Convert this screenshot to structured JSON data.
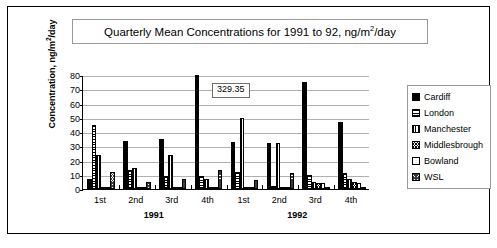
{
  "chart_data": {
    "type": "bar",
    "title": "Quarterly Mean Concentrations for 1991 to 92, ng/m2/day",
    "title_parts": {
      "before_sup": "Quarterly Mean Concentrations for 1991 to 92, ng/m",
      "sup": "2",
      "after_sup": "/day"
    },
    "xlabel": "",
    "ylabel": "Concentration, ng/m2/day",
    "ylabel_parts": {
      "before_sup": "Concentration, ng/m",
      "sup": "2",
      "after_sup": "/day"
    },
    "ylim": [
      0,
      80
    ],
    "yticks": [
      0,
      10,
      20,
      30,
      40,
      50,
      60,
      70,
      80
    ],
    "grid": true,
    "legend_position": "right",
    "categories": [
      "1st",
      "2nd",
      "3rd",
      "4th",
      "1st",
      "2nd",
      "3rd",
      "4th"
    ],
    "group_labels": [
      "1991",
      "1992"
    ],
    "series": [
      {
        "name": "Cardiff",
        "values": [
          7,
          34,
          35,
          329.35,
          33,
          32,
          75,
          47
        ]
      },
      {
        "name": "London",
        "values": [
          45,
          13,
          9,
          9,
          12,
          2,
          10,
          11
        ]
      },
      {
        "name": "Manchester",
        "values": [
          24,
          15,
          24,
          7,
          50,
          32,
          5,
          7
        ]
      },
      {
        "name": "Middlesbrough",
        "values": [
          0,
          0,
          0,
          0,
          0,
          0,
          4,
          5
        ]
      },
      {
        "name": "Bowland",
        "values": [
          1,
          1,
          1,
          1,
          1,
          1,
          4,
          4
        ]
      },
      {
        "name": "WSL",
        "values": [
          12,
          5,
          7,
          13,
          6,
          11,
          0,
          0
        ]
      }
    ],
    "annotations": [
      {
        "label": "329.35",
        "series": "Cardiff",
        "category_index": 3,
        "note": "value exceeds axis maximum; bar is clipped"
      }
    ]
  },
  "legend": {
    "items": [
      {
        "label": "Cardiff",
        "pattern": "solid-black"
      },
      {
        "label": "London",
        "pattern": "horizontal-lines"
      },
      {
        "label": "Manchester",
        "pattern": "vertical-lines"
      },
      {
        "label": "Middlesbrough",
        "pattern": "crosshatch"
      },
      {
        "label": "Bowland",
        "pattern": "empty-white"
      },
      {
        "label": "WSL",
        "pattern": "dense-crosshatch"
      }
    ]
  }
}
